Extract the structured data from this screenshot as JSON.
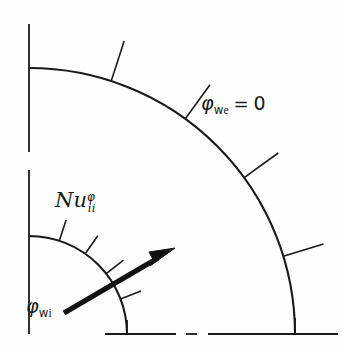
{
  "figure": {
    "type": "technical-line-diagram",
    "background_color": "#fefefe",
    "line_color": "#1a1a1a",
    "geometry": {
      "center_x": 29,
      "center_y": 334,
      "inner_radius": 98,
      "outer_radius": 266,
      "angle_start_deg": 0,
      "angle_end_deg": 90
    },
    "labels": {
      "outer_wall": {
        "symbol": "φ",
        "subscript": "w",
        "subsubscript": "e",
        "equals": "=",
        "value": "0"
      },
      "nusselt": {
        "base": "Nu",
        "superscript": "φ",
        "subscript": "ii"
      },
      "inner_wall": {
        "symbol": "φ",
        "subscript": "w",
        "subsubscript": "i"
      }
    },
    "outer_ticks": [
      {
        "angle_deg": 72,
        "length": 42
      },
      {
        "angle_deg": 54,
        "length": 42
      },
      {
        "angle_deg": 36,
        "length": 42
      },
      {
        "angle_deg": 17,
        "length": 42
      }
    ],
    "inner_ticks": [
      {
        "angle_deg": 72,
        "length": 22
      },
      {
        "angle_deg": 55,
        "length": 22
      },
      {
        "angle_deg": 38,
        "length": 22
      },
      {
        "angle_deg": 21,
        "length": 22
      }
    ],
    "arrow": {
      "tail_x": 64,
      "tail_y": 313,
      "tip_x": 173,
      "tip_y": 249,
      "stroke_width": 5
    },
    "axes": {
      "vertical_top_y": 24,
      "vertical_bottom_y": 334,
      "vertical_gap_start_y": 152,
      "vertical_gap_end_y": 170,
      "horizontal_left_x": 105,
      "horizontal_right_x": 338,
      "horizontal_y": 334,
      "horizontal_gap_start_x": 176,
      "horizontal_gap_end_x": 208,
      "horizontal_dash_start_x": 186,
      "horizontal_dash_end_x": 197
    }
  }
}
